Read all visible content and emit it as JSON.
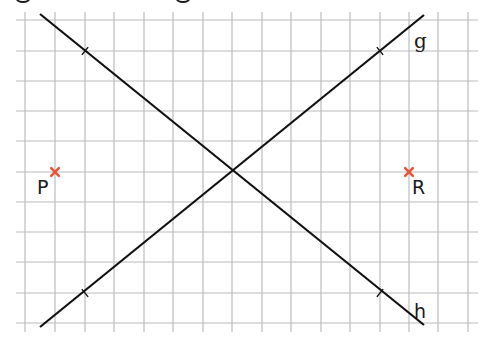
{
  "diagram": {
    "type": "coordinate-grid-construction",
    "canvas": {
      "width": 491,
      "height": 342
    },
    "colors": {
      "background": "#ffffff",
      "grid": "#b9bcbe",
      "line": "#111111",
      "point_marker": "#e8553a",
      "text": "#1a1a1a"
    },
    "grid": {
      "x_lines": [
        25,
        55,
        85,
        114,
        144,
        173,
        203,
        232,
        262,
        291,
        321,
        350,
        380,
        409,
        438,
        468
      ],
      "y_lines": [
        20,
        51,
        81,
        111,
        141,
        172,
        202,
        232,
        262,
        293,
        323
      ],
      "x_extent": [
        16,
        478
      ],
      "y_extent": [
        12,
        332
      ]
    },
    "lines": [
      {
        "name": "g",
        "label": "g",
        "from": [
          40,
          327
        ],
        "to": [
          424,
          15
        ],
        "label_pos": [
          414,
          48
        ],
        "ticks": [
          [
            85,
            293
          ],
          [
            380,
            51
          ]
        ]
      },
      {
        "name": "h",
        "label": "h",
        "from": [
          40,
          14
        ],
        "to": [
          424,
          325
        ],
        "label_pos": [
          414,
          318
        ],
        "ticks": [
          [
            85,
            51
          ],
          [
            380,
            293
          ]
        ]
      }
    ],
    "intersection": [
      232,
      172
    ],
    "points": [
      {
        "name": "P",
        "label": "P",
        "pos": [
          55,
          172
        ],
        "label_pos": [
          37,
          194
        ]
      },
      {
        "name": "R",
        "label": "R",
        "pos": [
          409,
          172
        ],
        "label_pos": [
          412,
          194
        ]
      }
    ],
    "clipped_heading_fragments": [
      [
        20,
        0
      ],
      [
        180,
        0
      ]
    ]
  }
}
